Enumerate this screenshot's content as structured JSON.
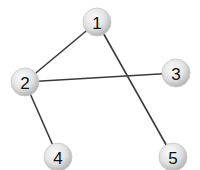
{
  "graph": {
    "nodes": [
      {
        "id": "1",
        "label": "1",
        "x": 97,
        "y": 22
      },
      {
        "id": "2",
        "label": "2",
        "x": 25,
        "y": 82
      },
      {
        "id": "3",
        "label": "3",
        "x": 176,
        "y": 73
      },
      {
        "id": "4",
        "label": "4",
        "x": 58,
        "y": 157
      },
      {
        "id": "5",
        "label": "5",
        "x": 173,
        "y": 157
      }
    ],
    "edges": [
      {
        "from": "1",
        "to": "2"
      },
      {
        "from": "1",
        "to": "5"
      },
      {
        "from": "2",
        "to": "3"
      },
      {
        "from": "2",
        "to": "4"
      }
    ],
    "node_radius": 14,
    "colors": {
      "node_fill_light": "#fafafa",
      "node_fill_dark": "#bdbdbd",
      "edge": "#3a3a3a",
      "label": "#111111"
    }
  }
}
